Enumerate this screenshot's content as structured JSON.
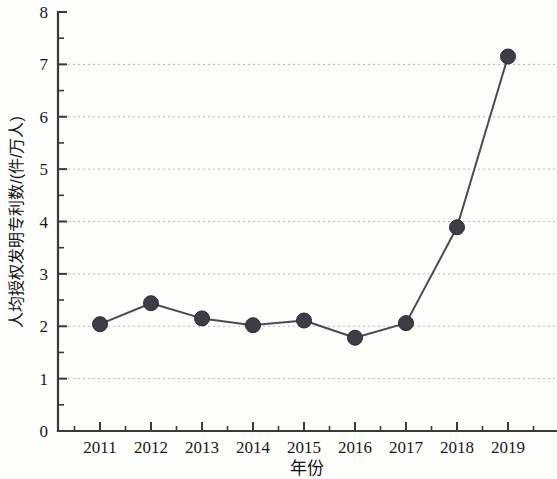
{
  "chart_data": {
    "type": "line",
    "title": "",
    "xlabel": "年份",
    "ylabel": "人均授权发明专利数/(件/万人)",
    "categories": [
      "2011",
      "2012",
      "2013",
      "2014",
      "2015",
      "2016",
      "2017",
      "2018",
      "2019"
    ],
    "values": [
      2.04,
      2.44,
      2.15,
      2.02,
      2.11,
      1.78,
      2.06,
      3.89,
      7.15
    ],
    "series": [
      {
        "name": "人均授权发明专利数",
        "values": [
          2.04,
          2.44,
          2.15,
          2.02,
          2.11,
          1.78,
          2.06,
          3.89,
          7.15
        ]
      }
    ],
    "xlim": [
      2010.5,
      2019.7
    ],
    "ylim": [
      0,
      8
    ],
    "y_ticks": [
      "0",
      "1",
      "2",
      "3",
      "4",
      "5",
      "6",
      "7",
      "8"
    ],
    "y_tick_values": [
      0,
      1,
      2,
      3,
      4,
      5,
      6,
      7,
      8
    ],
    "y_minor_step": 0.5,
    "x_ticks": [
      "2011",
      "2012",
      "2013",
      "2014",
      "2015",
      "2016",
      "2017",
      "2018",
      "2019"
    ],
    "grid": "horizontal-dotted-at-integers",
    "legend": "none",
    "legend_position": "none",
    "marker": "filled-circle",
    "marker_color": "#3d3d45",
    "line_color": "#4a4a52",
    "grid_color": "#b9b9b9",
    "axis_color": "#3a3a3a",
    "background_color": "#fdfdfc",
    "annotations": []
  }
}
